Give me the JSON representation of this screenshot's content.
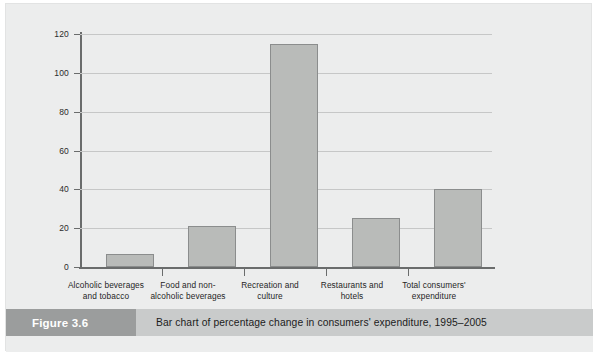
{
  "figure": {
    "number_label": "Figure 3.6",
    "caption": "Bar chart of percentage change in consumers' expenditure, 1995–2005"
  },
  "colors": {
    "page_background": "#eceded",
    "bar_fill": "#b9bbb9",
    "bar_outline": "#8b8d8d",
    "axis": "#6a6c6c",
    "gridline": "#c6c7c7",
    "caption_strip": "#c9cbcb",
    "figure_number_block": "#9b9d9d",
    "figure_number_text": "#ffffff"
  },
  "chart_data": {
    "type": "bar",
    "title": "",
    "xlabel": "",
    "ylabel": "Percentage change",
    "ylim": [
      0,
      120
    ],
    "ytick_labels": [
      "0",
      "20",
      "40",
      "60",
      "80",
      "100",
      "120"
    ],
    "yticks": [
      0,
      20,
      40,
      60,
      80,
      100,
      120
    ],
    "grid": true,
    "legend": "none",
    "categories": [
      "Alcoholic beverages and tobacco",
      "Food and non-alcoholic beverages",
      "Recreation and culture",
      "Restaurants and hotels",
      "Total consumers' expenditure"
    ],
    "category_label_lines": [
      [
        "Alcoholic beverages",
        "and tobacco"
      ],
      [
        "Food and non-",
        "alcoholic beverages"
      ],
      [
        "Recreation and",
        "culture"
      ],
      [
        "Restaurants and",
        "hotels"
      ],
      [
        "Total consumers'",
        "expenditure"
      ]
    ],
    "values": [
      6.5,
      21,
      115,
      25,
      40
    ]
  }
}
